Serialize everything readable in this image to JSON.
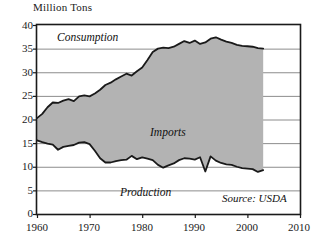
{
  "chart_data": {
    "type": "area",
    "title": "",
    "ylabel": "Million Tons",
    "xlabel": "",
    "xlim": [
      1960,
      2010
    ],
    "ylim": [
      0,
      40
    ],
    "grid": true,
    "legend_position": "inline-annotations",
    "annotations": [
      {
        "name": "consumption-label",
        "text": "Consumption",
        "x": 1965,
        "y": 37.5
      },
      {
        "name": "imports-label",
        "text": "Imports",
        "x": 1982,
        "y": 18.5
      },
      {
        "name": "production-label",
        "text": "Production",
        "x": 1977,
        "y": 6.2
      },
      {
        "name": "source-label",
        "text": "Source: USDA",
        "x": 2000,
        "y": 4.5
      }
    ],
    "xticks": [
      "1960",
      "1970",
      "1980",
      "1990",
      "2000",
      "2010"
    ],
    "yticks": [
      "0",
      "5",
      "10",
      "15",
      "20",
      "25",
      "30",
      "35",
      "40"
    ],
    "shaded_band": {
      "name": "Imports",
      "fill_color": "#b3b3b3",
      "between": [
        "Production",
        "Consumption"
      ]
    },
    "x": [
      1960,
      1961,
      1962,
      1963,
      1964,
      1965,
      1966,
      1967,
      1968,
      1969,
      1970,
      1971,
      1972,
      1973,
      1974,
      1975,
      1976,
      1977,
      1978,
      1979,
      1980,
      1981,
      1982,
      1983,
      1984,
      1985,
      1986,
      1987,
      1988,
      1989,
      1990,
      1991,
      1992,
      1993,
      1994,
      1995,
      1996,
      1997,
      1998,
      1999,
      2000,
      2001,
      2002,
      2003
    ],
    "series": [
      {
        "name": "Consumption",
        "color": "#1a1a1a",
        "values": [
          20.3,
          21.2,
          22.6,
          23.6,
          23.5,
          24.0,
          24.3,
          23.9,
          24.9,
          25.1,
          24.9,
          25.5,
          26.3,
          27.3,
          27.8,
          28.5,
          29.1,
          29.7,
          29.3,
          30.2,
          31.0,
          32.6,
          34.3,
          35.0,
          35.2,
          35.1,
          35.4,
          36.0,
          36.6,
          36.2,
          36.7,
          36.0,
          36.3,
          37.1,
          37.4,
          36.9,
          36.5,
          36.2,
          35.8,
          35.6,
          35.5,
          35.4,
          35.1,
          35.0
        ]
      },
      {
        "name": "Production",
        "color": "#1a1a1a",
        "values": [
          15.6,
          15.2,
          14.9,
          14.7,
          13.6,
          14.2,
          14.4,
          14.6,
          15.1,
          15.2,
          14.8,
          13.4,
          11.8,
          10.9,
          10.9,
          11.2,
          11.4,
          11.5,
          12.3,
          11.6,
          12.0,
          11.7,
          11.4,
          10.4,
          9.8,
          10.3,
          10.7,
          11.4,
          11.8,
          11.7,
          11.5,
          12.0,
          9.0,
          12.2,
          11.3,
          10.8,
          10.5,
          10.4,
          10.0,
          9.7,
          9.6,
          9.5,
          8.9,
          9.3
        ]
      }
    ]
  },
  "axis": {
    "y_title": "Million Tons",
    "y_ticks": [
      {
        "label": "40",
        "value": 40
      },
      {
        "label": "35",
        "value": 35
      },
      {
        "label": "30",
        "value": 30
      },
      {
        "label": "25",
        "value": 25
      },
      {
        "label": "20",
        "value": 20
      },
      {
        "label": "15",
        "value": 15
      },
      {
        "label": "10",
        "value": 10
      },
      {
        "label": "5",
        "value": 5
      },
      {
        "label": "0",
        "value": 0
      }
    ],
    "x_ticks": [
      {
        "label": "1960",
        "value": 1960
      },
      {
        "label": "1970",
        "value": 1970
      },
      {
        "label": "1980",
        "value": 1980
      },
      {
        "label": "1990",
        "value": 1990
      },
      {
        "label": "2000",
        "value": 2000
      },
      {
        "label": "2010",
        "value": 2010
      }
    ]
  },
  "labels": {
    "consumption": "Consumption",
    "imports": "Imports",
    "production": "Production",
    "source": "Source: USDA"
  },
  "colors": {
    "frame": "#1a1a1a",
    "grid": "#8c8c8c",
    "band_fill": "#b3b3b3",
    "line": "#1a1a1a",
    "background": "#ffffff"
  }
}
